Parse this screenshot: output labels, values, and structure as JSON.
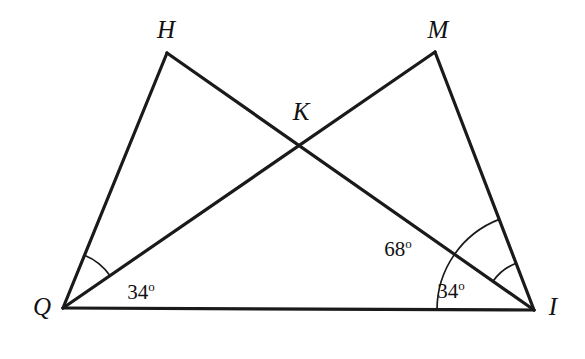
{
  "figure": {
    "type": "geometry-diagram",
    "background_color": "#ffffff",
    "stroke_color": "#1a1a1a",
    "width": 585,
    "height": 359
  },
  "points": {
    "Q": {
      "label": "Q",
      "x": 63,
      "y": 308,
      "label_x": 42,
      "label_y": 306
    },
    "H": {
      "label": "H",
      "x": 167,
      "y": 53,
      "label_x": 166,
      "label_y": 29
    },
    "K": {
      "label": "K",
      "x": 300,
      "y": 147,
      "label_x": 301,
      "label_y": 111
    },
    "M": {
      "label": "M",
      "x": 435,
      "y": 52,
      "label_x": 438,
      "label_y": 29
    },
    "I": {
      "label": "I",
      "x": 534,
      "y": 310,
      "label_x": 553,
      "label_y": 306
    }
  },
  "segments": [
    {
      "name": "QI",
      "from": "Q",
      "to": "I"
    },
    {
      "name": "QH",
      "from": "Q",
      "to": "H"
    },
    {
      "name": "HI",
      "from": "H",
      "to": "I"
    },
    {
      "name": "QM",
      "from": "Q",
      "to": "M"
    },
    {
      "name": "MI",
      "from": "M",
      "to": "I"
    }
  ],
  "angles": [
    {
      "name": "angle-HQM",
      "vertex": "Q",
      "value": "34",
      "degree_symbol": "o",
      "label_x": 141,
      "label_y": 291,
      "arc_radius": 57
    },
    {
      "name": "angle-MIQ",
      "vertex": "I",
      "value": "68",
      "degree_symbol": "o",
      "label_x": 398,
      "label_y": 248,
      "arc_radius": 97
    },
    {
      "name": "angle-MIH",
      "vertex": "I",
      "value": "34",
      "degree_symbol": "o",
      "label_x": 451,
      "label_y": 290,
      "arc_radius": 50
    }
  ],
  "chart_data": {
    "type": "diagram",
    "title": "",
    "vertices": [
      "Q",
      "H",
      "K",
      "M",
      "I"
    ],
    "edges": [
      "QI",
      "QH",
      "HI",
      "QM",
      "MI"
    ],
    "angle_measures": [
      {
        "at": "Q",
        "between": [
          "QH",
          "QM"
        ],
        "degrees": 34
      },
      {
        "at": "I",
        "between": [
          "IQ",
          "IM"
        ],
        "degrees": 68
      },
      {
        "at": "I",
        "between": [
          "IH",
          "IM"
        ],
        "degrees": 34
      }
    ]
  }
}
